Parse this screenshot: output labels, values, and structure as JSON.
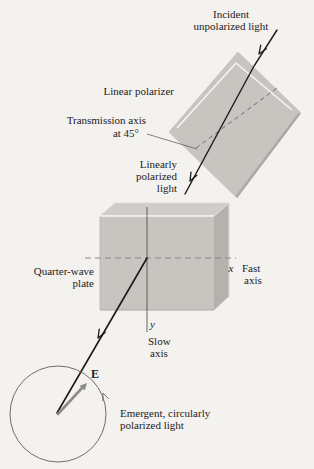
{
  "figure": {
    "labels": {
      "incident_line1": "Incident",
      "incident_line2": "unpolarized light",
      "linear_polarizer": "Linear polarizer",
      "transmission_axis_line1": "Transmission axis",
      "transmission_axis_line2": "at 45°",
      "linearly_line1": "Linearly",
      "linearly_line2": "polarized",
      "linearly_line3": "light",
      "quarter_wave_line1": "Quarter-wave",
      "quarter_wave_line2": "plate",
      "fast_axis_symbol": "x",
      "fast_axis_line1": "Fast",
      "fast_axis_line2": "axis",
      "slow_axis_symbol": "y",
      "slow_axis_line1": "Slow",
      "slow_axis_line2": "axis",
      "e_vector": "E",
      "emergent_line1": "Emergent, circularly",
      "emergent_line2": "polarized light"
    },
    "colors": {
      "paper": "#f4f2ee",
      "slab_face": "#c7c5c0",
      "slab_top": "#cfcdc8",
      "slab_side": "#b4b2ad",
      "edge_highlight": "#f6f5f2",
      "edge_shadow": "#aaa8a3",
      "beam": "#1c1a18",
      "axis_dash": "#8a8884",
      "e_arrow": "#8d8c8a",
      "circle": "#6f6e6b",
      "text": "#23211e"
    }
  }
}
